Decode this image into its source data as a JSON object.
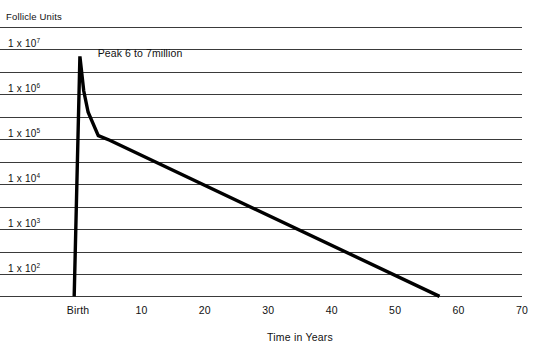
{
  "chart_data": {
    "type": "line",
    "title": "",
    "ylabel": "Follicle Units",
    "xlabel": "Time in Years",
    "yscale": "log",
    "ylim": [
      1,
      10000000
    ],
    "xlim": [
      -2,
      70
    ],
    "grid": true,
    "legend": "none",
    "y_tick_labels": [
      {
        "mantissa": "1 x 10",
        "exponent": "7",
        "value": 10000000
      },
      {
        "mantissa": "1 x 10",
        "exponent": "6",
        "value": 1000000
      },
      {
        "mantissa": "1 x 10",
        "exponent": "5",
        "value": 100000
      },
      {
        "mantissa": "1 x 10",
        "exponent": "4",
        "value": 10000
      },
      {
        "mantissa": "1 x 10",
        "exponent": "3",
        "value": 1000
      },
      {
        "mantissa": "1 x 10",
        "exponent": "2",
        "value": 100
      }
    ],
    "x_tick_labels": [
      "Birth",
      "10",
      "20",
      "30",
      "40",
      "50",
      "60",
      "70"
    ],
    "x_tick_values": [
      0,
      10,
      20,
      30,
      40,
      50,
      60,
      70
    ],
    "annotations": [
      {
        "text": "Peak 6 to 7million",
        "x": 2,
        "y": 7000000
      }
    ],
    "series": [
      {
        "name": "Ovarian follicle count",
        "points": [
          {
            "x": -0.6,
            "y": 1
          },
          {
            "x": 0.3,
            "y": 7000000
          },
          {
            "x": 0.9,
            "y": 1200000
          },
          {
            "x": 1.6,
            "y": 400000
          },
          {
            "x": 3.2,
            "y": 120000
          },
          {
            "x": 5.0,
            "y": 95000
          },
          {
            "x": 57.0,
            "y": 1
          }
        ]
      }
    ],
    "gridline_count": 13
  },
  "colors": {
    "line": "#000000",
    "gridline": "#3a3a3a",
    "background": "#ffffff",
    "text": "#111111"
  }
}
